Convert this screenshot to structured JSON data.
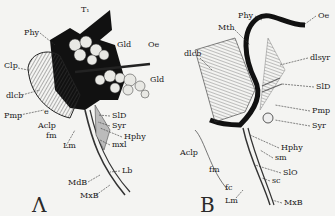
{
  "figure": {
    "panels": [
      {
        "id": "A",
        "panel_label": "Λ",
        "labels": {
          "T1": "T₁",
          "Phy": "Phy",
          "Gld_top": "Gld",
          "Oe": "Oe",
          "Gld_right": "Gld",
          "Clp": "Clp",
          "dlcb": "dlcb",
          "Pmp": "Pmp",
          "e": "e",
          "Aclp": "Aclp",
          "fm": "fm",
          "Lm": "Lm",
          "SlD": "SlD",
          "Syr": "Syr",
          "Hphy": "Hphy",
          "mxl": "mxl",
          "Lb": "Lb",
          "MdB": "MdB",
          "MxB": "MxB"
        }
      },
      {
        "id": "B",
        "panel_label": "B",
        "labels": {
          "Phy": "Phy",
          "Oe": "Oe",
          "Mth": "Mth",
          "dlcb": "dlcb",
          "dlsyr": "dlsyr",
          "SlD": "SlD",
          "Pmp": "Pmp",
          "Syr": "Syr",
          "Aclp": "Aclp",
          "Hphy": "Hphy",
          "sm": "sm",
          "fm": "fm",
          "SlO": "SlO",
          "fc": "fc",
          "sc": "sc",
          "Lm": "Lm",
          "MxB": "MxB"
        }
      }
    ],
    "colors": {
      "ink": "#1a1a1a",
      "paper": "#f4f4f2",
      "hatch": "#555555"
    }
  }
}
